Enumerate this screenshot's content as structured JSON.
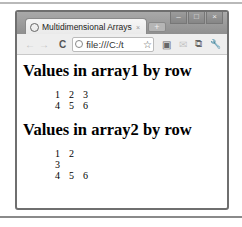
{
  "browser": {
    "tab": {
      "title": "Multidimensional Arrays",
      "favicon": "globe-icon",
      "close_glyph": "×"
    },
    "new_tab_glyph": "+",
    "window_controls": {
      "minimize": "–",
      "maximize": "□",
      "close": "×"
    },
    "toolbar": {
      "back_glyph": "←",
      "forward_glyph": "→",
      "reload_glyph": "C",
      "url": "file:///C:/t",
      "star_glyph": "☆",
      "translate_glyph": "▣",
      "mail_glyph": "✉",
      "extension_glyph": "⧉",
      "wrench_glyph": "🔧"
    }
  },
  "page": {
    "sections": [
      {
        "heading": "Values in array1 by row",
        "rows": [
          [
            "1",
            "2",
            "3"
          ],
          [
            "4",
            "5",
            "6"
          ]
        ]
      },
      {
        "heading": "Values in array2 by row",
        "rows": [
          [
            "1",
            "2"
          ],
          [
            "3"
          ],
          [
            "4",
            "5",
            "6"
          ]
        ]
      }
    ]
  }
}
